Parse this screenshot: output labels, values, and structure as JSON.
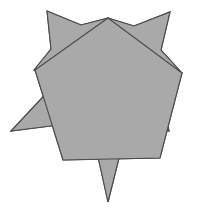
{
  "canvas": {
    "width": 215,
    "height": 215,
    "background_color": "#ffffff",
    "title": "overlapping-pentagon-and-star"
  },
  "style": {
    "fill_color": "#a9a9a9",
    "stroke_color": "#4a4a4a",
    "stroke_width": 1.1,
    "texture": "speckled-gray-noise"
  },
  "shapes": [
    {
      "name": "pentagram-star",
      "type": "polygon",
      "sides": 10,
      "description": "five-pointed star rotated so one point aims down",
      "points": "47,11 81,25 108,18 134,26 170,12 161,50 182,73 160,84 169,131 128,122 108,202 90,121 11,131 56,83 34,70 51,49"
    },
    {
      "name": "pentagon",
      "type": "polygon",
      "sides": 5,
      "description": "regular pentagon with apex at top",
      "points": "108,18 182,73 160,158 63,160 35,70"
    }
  ],
  "chart_data": {
    "type": "diagram",
    "title": "",
    "elements": [
      {
        "label": "star",
        "vertices": 10,
        "outer_tips": [
          [
            47,
            11
          ],
          [
            170,
            12
          ],
          [
            203,
            130
          ],
          [
            108,
            202
          ],
          [
            11,
            131
          ]
        ],
        "inner_points": [
          [
            108,
            18
          ],
          [
            161,
            50
          ],
          [
            160,
            84
          ],
          [
            90,
            121
          ],
          [
            56,
            83
          ]
        ]
      },
      {
        "label": "pentagon",
        "vertices": 5,
        "points": [
          [
            108,
            18
          ],
          [
            182,
            73
          ],
          [
            160,
            158
          ],
          [
            63,
            160
          ],
          [
            35,
            70
          ]
        ]
      }
    ]
  }
}
